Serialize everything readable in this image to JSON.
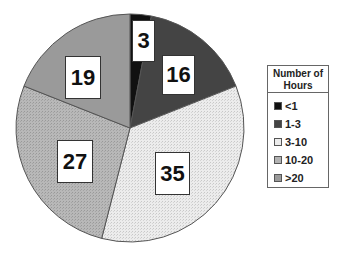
{
  "chart_data": {
    "type": "pie",
    "title": "",
    "legend_title": "Number of Hours",
    "legend_position": "right",
    "start_angle": "12 o'clock",
    "direction": "clockwise",
    "categories": [
      "<1",
      "1-3",
      "3-10",
      "10-20",
      ">20"
    ],
    "values": [
      3,
      16,
      35,
      27,
      19
    ],
    "colors": [
      "#111111",
      "#444444",
      "#e6e6e6",
      "#b2b2b2",
      "#9a9a9a"
    ]
  },
  "legend": {
    "title_line1": "Number of",
    "title_line2": "Hours",
    "items": [
      {
        "label": "<1",
        "color": "#111111"
      },
      {
        "label": "1-3",
        "color": "#444444"
      },
      {
        "label": "3-10",
        "color": "#e6e6e6"
      },
      {
        "label": "10-20",
        "color": "#b2b2b2"
      },
      {
        "label": ">20",
        "color": "#9a9a9a"
      }
    ]
  },
  "labels": [
    {
      "text": "3"
    },
    {
      "text": "16"
    },
    {
      "text": "35"
    },
    {
      "text": "27"
    },
    {
      "text": "19"
    }
  ]
}
